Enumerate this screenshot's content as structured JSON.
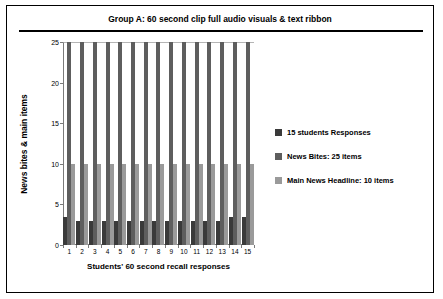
{
  "chart_data": {
    "type": "bar",
    "title": "Group A: 60 second clip full audio visuals & text ribbon",
    "xlabel": "Students' 60 second recall responses",
    "ylabel": "News bites & main items",
    "categories": [
      "1",
      "2",
      "3",
      "4",
      "5",
      "6",
      "7",
      "8",
      "9",
      "10",
      "11",
      "12",
      "13",
      "14",
      "15"
    ],
    "yticks": [
      0,
      5,
      10,
      15,
      20,
      25
    ],
    "ylim": [
      0,
      25
    ],
    "grid": false,
    "legend_position": "right",
    "series": [
      {
        "name": "15 students Responses",
        "color": "#3a3a3a",
        "values": [
          3.5,
          3,
          3,
          3,
          3,
          3,
          3,
          3,
          3,
          3,
          3,
          3,
          3,
          3.5,
          3.5
        ]
      },
      {
        "name": "News Bites: 25 items",
        "color": "#5e5e5e",
        "values": [
          25,
          25,
          25,
          25,
          25,
          25,
          25,
          25,
          25,
          25,
          25,
          25,
          25,
          25,
          25
        ]
      },
      {
        "name": "Main News Headline: 10 items",
        "color": "#9a9a9a",
        "values": [
          10,
          10,
          10,
          10,
          10,
          10,
          10,
          10,
          10,
          10,
          10,
          10,
          10,
          10,
          10
        ]
      }
    ]
  }
}
